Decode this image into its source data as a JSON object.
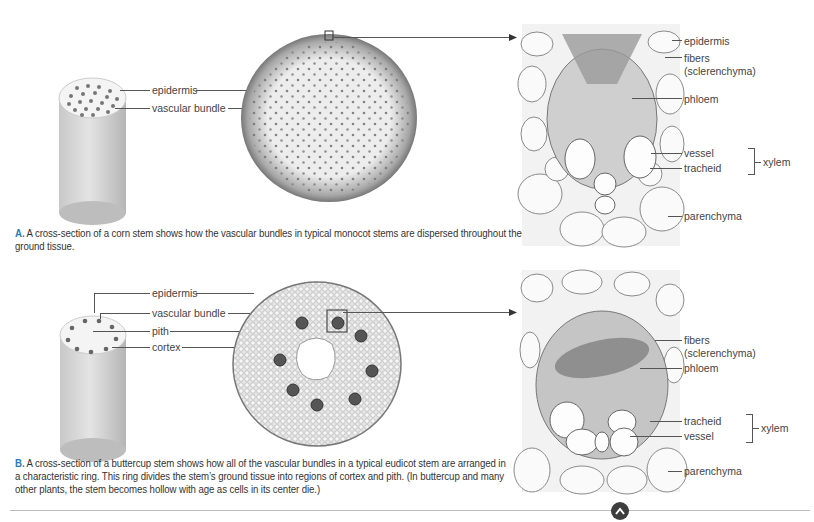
{
  "panel_a": {
    "stem_labels": [
      "epidermis",
      "vascular bundle"
    ],
    "detail_labels": {
      "epidermis": "epidermis",
      "fibers": "fibers",
      "fibers_sub": "(sclerenchyma)",
      "phloem": "phloem",
      "vessel": "vessel",
      "tracheid": "tracheid",
      "xylem": "xylem",
      "parenchyma": "parenchyma"
    },
    "caption_letter": "A.",
    "caption_text": " A cross-section of a corn stem shows how the vascular bundles in typical monocot stems are dispersed throughout the ground tissue."
  },
  "panel_b": {
    "stem_labels": [
      "epidermis",
      "vascular bundle",
      "pith",
      "cortex"
    ],
    "detail_labels": {
      "fibers": "fibers",
      "fibers_sub": "(sclerenchyma)",
      "phloem": "phloem",
      "tracheid": "tracheid",
      "vessel": "vessel",
      "xylem": "xylem",
      "parenchyma": "parenchyma"
    },
    "caption_letter": "B.",
    "caption_text": " A cross-section of a buttercup stem shows how all of the vascular bundles in a typical eudicot stem are arranged in a characteristic ring. This ring divides the stem’s ground tissue into regions of cortex and pith. (In buttercup and many other plants, the stem becomes hollow with age as cells in its center die.)"
  },
  "nav": {
    "scroll_top_icon": "chevron-up-icon"
  },
  "colors": {
    "caption_letter": "#2a7db8",
    "button": "#3d3d3d"
  }
}
